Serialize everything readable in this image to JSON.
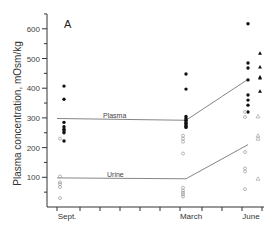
{
  "chart_data": {
    "type": "scatter",
    "title": "",
    "panel_label": "A",
    "xlabel": "",
    "ylabel": "Plasma concentration, mOsm/kg",
    "ylim": [
      0,
      650
    ],
    "yticks": [
      100,
      200,
      300,
      400,
      500,
      600
    ],
    "categories": [
      "Sept.",
      "March",
      "June"
    ],
    "grid": false,
    "legend": "inline labels",
    "series": [
      {
        "name": "Plasma (individual, filled circles)",
        "marker": "filled-circle",
        "points": [
          {
            "x": "Sept.",
            "values": [
              407,
              363,
              285,
              270,
              262,
              256,
              250,
              222
            ]
          },
          {
            "x": "March",
            "values": [
              448,
              397,
              305,
              298,
              292,
              287,
              282,
              277,
              272,
              268
            ]
          },
          {
            "x": "June",
            "values": [
              617,
              485,
              468,
              428,
              377,
              360,
              343,
              320
            ]
          }
        ]
      },
      {
        "name": "Urine (individual, open circles)",
        "marker": "open-circle",
        "points": [
          {
            "x": "Sept.",
            "values": [
              230,
              103,
              83,
              77,
              67,
              30
            ]
          },
          {
            "x": "March",
            "values": [
              240,
              230,
              220,
              180,
              65,
              55,
              48,
              42,
              35
            ]
          },
          {
            "x": "June",
            "values": [
              320,
              303,
              185,
              130,
              120,
              60
            ]
          }
        ]
      },
      {
        "name": "June triangles (filled)",
        "marker": "filled-triangle",
        "points": [
          {
            "x": "June",
            "values": [
              518,
              471,
              438,
              434,
              390
            ]
          }
        ]
      },
      {
        "name": "June triangles (open)",
        "marker": "open-triangle",
        "points": [
          {
            "x": "June",
            "values": [
              305,
              240,
              230,
              95
            ]
          }
        ]
      },
      {
        "name": "Plasma",
        "marker": "line",
        "values": [
          298,
          292,
          430
        ]
      },
      {
        "name": "Urine",
        "marker": "line",
        "values": [
          98,
          95,
          210
        ]
      }
    ]
  }
}
